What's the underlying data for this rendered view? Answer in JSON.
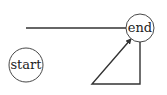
{
  "diagram": {
    "type": "state-graph",
    "nodes": [
      {
        "id": "start",
        "label": "start",
        "cx": 26,
        "cy": 65,
        "r": 17
      },
      {
        "id": "end",
        "label": "end",
        "cx": 140,
        "cy": 28,
        "r": 14
      }
    ],
    "edges": [
      {
        "id": "line-to-end",
        "description": "horizontal line into end",
        "points": [
          [
            26,
            28
          ],
          [
            126,
            28
          ]
        ],
        "arrow": false
      },
      {
        "id": "loop-to-end",
        "description": "path from below, left, then diagonal arrow into end",
        "points": [
          [
            140,
            42
          ],
          [
            140,
            84
          ],
          [
            92,
            84
          ],
          [
            131,
            39
          ]
        ],
        "arrow": true
      }
    ],
    "colors": {
      "stroke": "#333333",
      "background": "#ffffff",
      "text": "#222222"
    }
  }
}
